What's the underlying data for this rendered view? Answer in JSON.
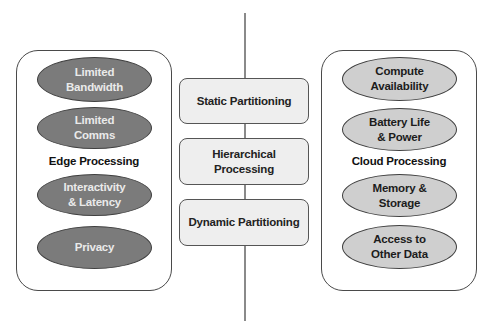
{
  "diagram": {
    "edge": {
      "label": "Edge Processing",
      "items": [
        {
          "line1": "Limited",
          "line2": "Bandwidth"
        },
        {
          "line1": "Limited",
          "line2": "Comms"
        },
        {
          "line1": "Interactivity",
          "line2": "& Latency"
        },
        {
          "line1": "Privacy",
          "line2": ""
        }
      ],
      "fill_color": "#7b7b7b"
    },
    "cloud": {
      "label": "Cloud Processing",
      "items": [
        {
          "line1": "Compute",
          "line2": "Availability"
        },
        {
          "line1": "Battery Life",
          "line2": "& Power"
        },
        {
          "line1": "Memory &",
          "line2": "Storage"
        },
        {
          "line1": "Access to",
          "line2": "Other Data"
        }
      ],
      "fill_color": "#cfcfcf"
    },
    "strategies": [
      {
        "line1": "Static Partitioning",
        "line2": ""
      },
      {
        "line1": "Hierarchical",
        "line2": "Processing"
      },
      {
        "line1": "Dynamic Partitioning",
        "line2": ""
      }
    ]
  }
}
